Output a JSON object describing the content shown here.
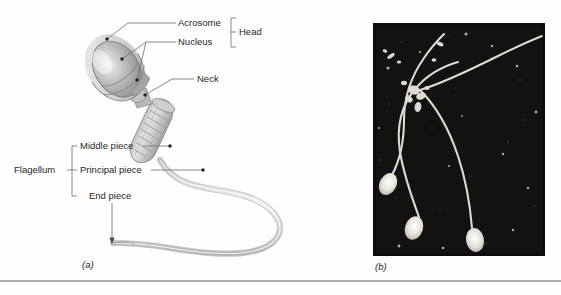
{
  "figure": {
    "panels": [
      {
        "id": "a",
        "caption": "(a)",
        "type": "illustration"
      },
      {
        "id": "b",
        "caption": "(b)",
        "type": "micrograph"
      }
    ]
  },
  "diagram": {
    "labels": {
      "acrosome": "Acrosome",
      "nucleus": "Nucleus",
      "head": "Head",
      "neck": "Neck",
      "middle_piece": "Middle piece",
      "principal_piece": "Principal piece",
      "end_piece": "End piece",
      "flagellum": "Flagellum"
    },
    "groups": [
      {
        "name": "Head",
        "members": [
          "Acrosome",
          "Nucleus"
        ]
      },
      {
        "name": "Flagellum",
        "members": [
          "Middle piece",
          "Principal piece",
          "End piece"
        ]
      }
    ]
  },
  "micrograph": {
    "background_color": "#121212",
    "cell_color": "#e8e6e0",
    "cell_count": 3,
    "description": "Three sperm cells with bright oval heads and long curving flagella on a dark field"
  },
  "colors": {
    "page_background": "#fefefe",
    "leader_line": "#6d6d6d",
    "text": "#1f1f1f",
    "rule": "#5b5b5b",
    "acrosome_fill": "#d9d9d9",
    "nucleus_fill": "#9a9a9a",
    "tail_fill": "#d5d5d5"
  }
}
